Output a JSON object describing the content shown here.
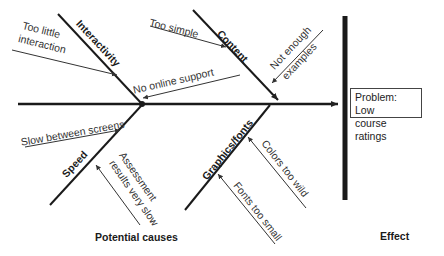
{
  "diagram": {
    "type": "fishbone",
    "effect_box": {
      "line1": "Problem: Low",
      "line2": "course ratings"
    },
    "footer": {
      "causes_label": "Potential causes",
      "effect_label": "Effect"
    },
    "categories": [
      {
        "name": "Interactivity",
        "causes": [
          "Too little interaction",
          "No online support"
        ]
      },
      {
        "name": "Content",
        "causes": [
          "Too simple",
          "Not enough examples"
        ]
      },
      {
        "name": "Speed",
        "causes": [
          "Slow between screens",
          "Assessment results very slow"
        ]
      },
      {
        "name": "Graphics/fonts",
        "causes": [
          "Colors too wild",
          "Fonts too small"
        ]
      }
    ],
    "labels": {
      "too_little_1": "Too little",
      "too_little_2": "interaction",
      "no_online": "No online support",
      "too_simple": "Too simple",
      "not_enough_1": "Not enough",
      "not_enough_2": "examples",
      "slow_between": "Slow between screens",
      "assess_1": "Assessment",
      "assess_2": "results very slow",
      "colors_wild": "Colors too wild",
      "fonts_small": "Fonts too small"
    }
  }
}
